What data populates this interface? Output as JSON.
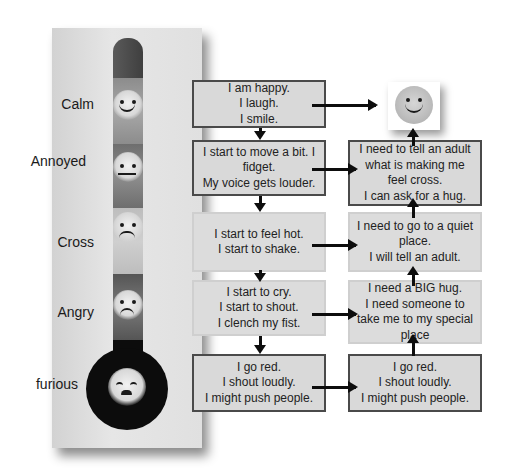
{
  "thermometer": {
    "levels": [
      {
        "label": "Calm",
        "face": "happy-face"
      },
      {
        "label": "Annoyed",
        "face": "neutral-face"
      },
      {
        "label": "Cross",
        "face": "slight-frown-face"
      },
      {
        "label": "Angry",
        "face": "sad-face"
      },
      {
        "label": "furious",
        "face": "furious-face"
      }
    ]
  },
  "feelings": [
    {
      "lines": [
        "I am happy.",
        "I laugh.",
        "I smile."
      ]
    },
    {
      "lines": [
        "I start to move a bit. I",
        "fidget.",
        "My voice gets louder."
      ]
    },
    {
      "lines": [
        "I start to feel hot.",
        "I start to shake."
      ]
    },
    {
      "lines": [
        "I start to cry.",
        "I start to shout.",
        "I clench my fist."
      ]
    },
    {
      "lines": [
        "I go red.",
        "I shout loudly.",
        "I might push people."
      ]
    }
  ],
  "strategies": [
    {
      "lines": [
        "I need to tell an adult",
        "what is making me",
        "feel cross.",
        "I can ask for a hug."
      ]
    },
    {
      "lines": [
        "I need to go to a quiet",
        "place.",
        "I will tell an adult."
      ]
    },
    {
      "lines": [
        "I need a BIG hug.",
        "I need someone to",
        "take me to my special",
        "place"
      ]
    },
    {
      "lines": [
        "I go red.",
        "I shout loudly.",
        "I might push people."
      ]
    }
  ],
  "goal": {
    "icon": "smiley-face"
  },
  "colors": {
    "box_fill": "#d9d9d9",
    "border": "#4a4a4a",
    "arrow": "#0d0d0d",
    "bulb": "#0c0c0c"
  }
}
